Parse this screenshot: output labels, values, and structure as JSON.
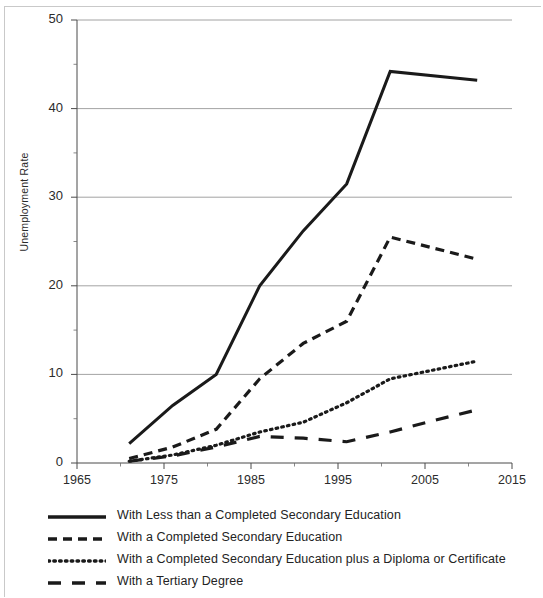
{
  "chart_data": {
    "type": "line",
    "title": "",
    "subtitle": "",
    "xlabel": "",
    "ylabel": "Unemployment Rate",
    "xlim": [
      1965,
      2015
    ],
    "ylim": [
      0,
      50
    ],
    "xticks": [
      1965,
      1975,
      1985,
      1995,
      2005,
      2015
    ],
    "xtick_labels": [
      "1965",
      "1975",
      "1985",
      "1995",
      "2005",
      "2015"
    ],
    "yticks": [
      0,
      10,
      20,
      30,
      40,
      50
    ],
    "ytick_labels": [
      "0",
      "10",
      "20",
      "30",
      "40",
      "50"
    ],
    "minor_xtick_interval": 5,
    "minor_ytick_interval": 5,
    "grid": "horizontal",
    "legend_position": "below",
    "series": [
      {
        "name": "With Less than a Completed Secondary Education",
        "style": "solid",
        "color": "#1a1a1a",
        "x": [
          1971,
          1976,
          1981,
          1986,
          1991,
          1996,
          2001,
          2011
        ],
        "values": [
          2.2,
          6.5,
          10.0,
          20.0,
          26.2,
          31.5,
          44.2,
          43.2
        ]
      },
      {
        "name": "With a Completed Secondary Education",
        "style": "dashed",
        "color": "#1a1a1a",
        "x": [
          1971,
          1976,
          1981,
          1986,
          1991,
          1996,
          2001,
          2011
        ],
        "values": [
          0.5,
          1.8,
          3.8,
          9.5,
          13.5,
          16.0,
          25.5,
          23.0
        ]
      },
      {
        "name": "With a Completed Secondary Education plus a Diploma or Certificate",
        "style": "dotted",
        "color": "#1a1a1a",
        "x": [
          1971,
          1976,
          1981,
          1986,
          1991,
          1996,
          2001,
          2006,
          2011
        ],
        "values": [
          0.2,
          0.9,
          2.0,
          3.5,
          4.6,
          6.8,
          9.5,
          10.5,
          11.5
        ]
      },
      {
        "name": "With a Tertiary Degree",
        "style": "longdash",
        "color": "#1a1a1a",
        "x": [
          1971,
          1976,
          1981,
          1986,
          1991,
          1996,
          2001,
          2006,
          2011
        ],
        "values": [
          0.2,
          0.8,
          1.8,
          3.0,
          2.8,
          2.4,
          3.5,
          4.8,
          6.0
        ]
      }
    ]
  },
  "axes": {
    "y_title": "Unemployment Rate"
  },
  "legend": {
    "items": [
      {
        "label": "With Less than a Completed Secondary Education",
        "style": "solid"
      },
      {
        "label": "With a Completed Secondary Education",
        "style": "dashed"
      },
      {
        "label": "With a Completed Secondary Education plus a Diploma or Certificate",
        "style": "dotted"
      },
      {
        "label": "With a Tertiary Degree",
        "style": "longdash"
      }
    ]
  }
}
